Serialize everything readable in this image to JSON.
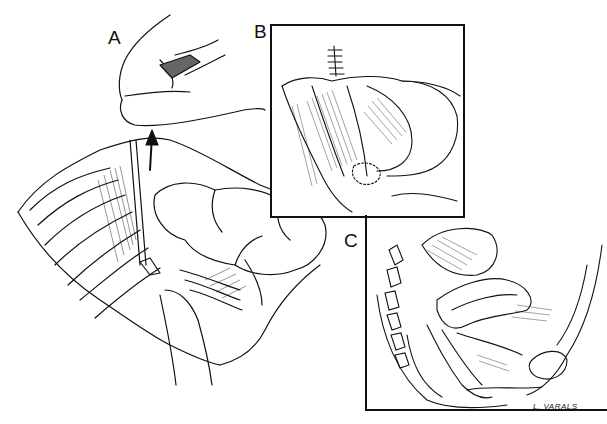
{
  "figure": {
    "type": "medical line illustration",
    "panels": [
      {
        "label": "A",
        "description": "Surgical view with hand retracting tissue, ureteral catheter/stent and bowel loops"
      },
      {
        "label": "B",
        "description": "Inset: sutured closure with pelvic structures"
      },
      {
        "label": "C",
        "description": "Inset: sagittal section of female pelvis"
      }
    ],
    "signature": "L. VARALS",
    "colors": {
      "ink": "#111111",
      "background": "#ffffff"
    }
  }
}
